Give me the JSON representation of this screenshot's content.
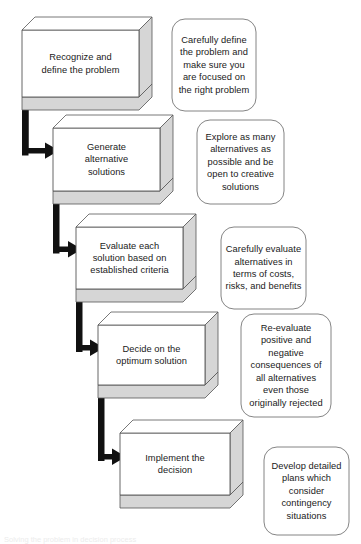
{
  "diagram": {
    "type": "flowchart",
    "background_color": "#ffffff",
    "box_face_color": "#ffffff",
    "box_shade_color": "#d6d6d6",
    "box_line_color": "#555555",
    "connector_color": "#111111",
    "callout_line_color": "#777777",
    "text_color": "#1a1a1a"
  },
  "steps": [
    {
      "id": "step-1",
      "label": "Recognize and\ndefine the  problem",
      "order": 1,
      "box": {
        "x": 22,
        "y": 30,
        "w": 117,
        "h": 67,
        "depth": 13
      },
      "text_box": {
        "x": 22,
        "y": 30,
        "w": 117,
        "h": 67
      }
    },
    {
      "id": "step-2",
      "label": "Generate\nalternative\nsolutions",
      "order": 2,
      "box": {
        "x": 53,
        "y": 128,
        "w": 107,
        "h": 63,
        "depth": 13
      },
      "text_box": {
        "x": 53,
        "y": 128,
        "w": 107,
        "h": 63
      }
    },
    {
      "id": "step-3",
      "label": "Evaluate each\nsolution based on\nestablished criteria",
      "order": 3,
      "box": {
        "x": 76,
        "y": 227,
        "w": 107,
        "h": 62,
        "depth": 13
      },
      "text_box": {
        "x": 76,
        "y": 227,
        "w": 107,
        "h": 62
      }
    },
    {
      "id": "step-4",
      "label": "Decide on the\noptimum solution",
      "order": 4,
      "box": {
        "x": 98,
        "y": 325,
        "w": 107,
        "h": 60,
        "depth": 13
      },
      "text_box": {
        "x": 98,
        "y": 325,
        "w": 107,
        "h": 60
      }
    },
    {
      "id": "step-5",
      "label": "Implement the\ndecision",
      "order": 5,
      "box": {
        "x": 120,
        "y": 433,
        "w": 110,
        "h": 62,
        "depth": 13
      },
      "text_box": {
        "x": 120,
        "y": 433,
        "w": 110,
        "h": 62
      }
    }
  ],
  "callouts": [
    {
      "id": "callout-1",
      "for_step": "step-1",
      "text": "Carefully define the problem and make sure you are focused on the right problem",
      "box": {
        "x": 172,
        "y": 19,
        "w": 84,
        "h": 92
      }
    },
    {
      "id": "callout-2",
      "for_step": "step-2",
      "text": "Explore as many alternatives as possible and be open to creative solutions",
      "box": {
        "x": 197,
        "y": 120,
        "w": 87,
        "h": 84
      }
    },
    {
      "id": "callout-3",
      "for_step": "step-3",
      "text": "Carefully evaluate alternatives in terms of costs, risks, and benefits",
      "box": {
        "x": 221,
        "y": 227,
        "w": 85,
        "h": 82
      }
    },
    {
      "id": "callout-4",
      "for_step": "step-4",
      "text": "Re-evaluate positive and negative consequences of all alternatives even those originally rejected",
      "box": {
        "x": 241,
        "y": 314,
        "w": 90,
        "h": 103
      }
    },
    {
      "id": "callout-5",
      "for_step": "step-5",
      "text": "Develop detailed plans which consider contingency situations",
      "box": {
        "x": 264,
        "y": 447,
        "w": 85,
        "h": 88
      }
    }
  ],
  "connectors": [
    {
      "id": "connector-1-2",
      "from": "step-1",
      "to": "step-2",
      "shape": "elbow-down-right"
    },
    {
      "id": "connector-2-3",
      "from": "step-2",
      "to": "step-3",
      "shape": "elbow-down-right"
    },
    {
      "id": "connector-3-4",
      "from": "step-3",
      "to": "step-4",
      "shape": "elbow-down-right"
    },
    {
      "id": "connector-4-5",
      "from": "step-4",
      "to": "step-5",
      "shape": "elbow-down-right"
    }
  ],
  "footer": {
    "clipped_text": "Solving the problem in decision process"
  }
}
